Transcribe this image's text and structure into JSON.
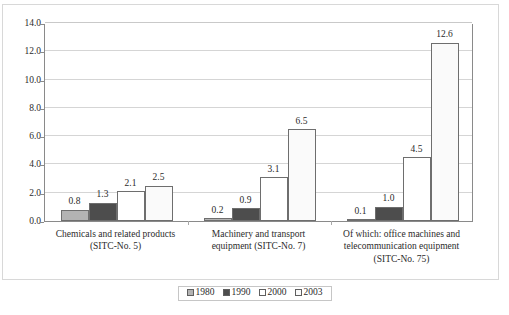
{
  "chart_data": {
    "type": "bar",
    "title": "",
    "subtitle": "",
    "xlabel": "",
    "ylabel": "",
    "ylim": [
      0.0,
      14.0
    ],
    "ytick_labels": [
      "0.0",
      "2.0",
      "4.0",
      "6.0",
      "8.0",
      "10.0",
      "12.0",
      "14.0"
    ],
    "ytick_values": [
      0.0,
      2.0,
      4.0,
      6.0,
      8.0,
      10.0,
      12.0,
      14.0
    ],
    "grid": "horizontal",
    "legend_position": "bottom-center",
    "categories": [
      "Chemicals and related products\n(SITC-No. 5)",
      "Machinery and transport\nequipment (SITC-No. 7)",
      "Of which: office machines and\ntelecommunication equipment\n(SITC-No. 75)"
    ],
    "category_lines": [
      [
        "Chemicals and related products",
        "(SITC-No. 5)"
      ],
      [
        "Machinery and transport",
        "equipment (SITC-No. 7)"
      ],
      [
        "Of which: office machines and",
        "telecommunication equipment",
        "(SITC-No. 75)"
      ]
    ],
    "series": [
      {
        "name": "1980",
        "color": "#b3b3b3",
        "values": [
          0.8,
          0.2,
          0.1
        ],
        "labels": [
          "0.8",
          "0.2",
          "0.1"
        ]
      },
      {
        "name": "1990",
        "color": "#4d4d4d",
        "values": [
          1.3,
          0.9,
          1.0
        ],
        "labels": [
          "1.3",
          "0.9",
          "1.0"
        ]
      },
      {
        "name": "2000",
        "color": "#ffffff",
        "values": [
          2.1,
          3.1,
          4.5
        ],
        "labels": [
          "2.1",
          "3.1",
          "4.5"
        ]
      },
      {
        "name": "2003",
        "color": "#fafafa",
        "values": [
          2.5,
          6.5,
          12.6
        ],
        "labels": [
          "2.5",
          "6.5",
          "12.6"
        ]
      }
    ]
  },
  "legend": {
    "items": [
      {
        "label": "1980",
        "color": "#b3b3b3"
      },
      {
        "label": "1990",
        "color": "#4d4d4d"
      },
      {
        "label": "2000",
        "color": "#ffffff"
      },
      {
        "label": "2003",
        "color": "#fafafa"
      }
    ]
  },
  "colors": {
    "axis": "#8a8a8a",
    "grid": "#d5d5d5",
    "bar_outline": "#6e6e6e",
    "text": "#2b2b2b",
    "frame": "#d8d8d8"
  }
}
